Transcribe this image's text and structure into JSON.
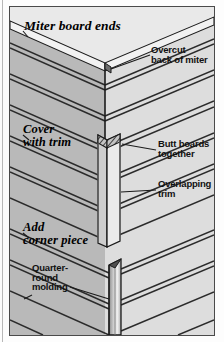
{
  "figure": {
    "panels": [
      {
        "id": "miter",
        "heading": "Miter board ends",
        "callouts": [
          {
            "id": "overcut",
            "text": "Overcut\nback of miter"
          }
        ]
      },
      {
        "id": "trim",
        "heading": "Cover\nwith trim",
        "callouts": [
          {
            "id": "butt-boards",
            "text": "Butt boards\ntogether"
          },
          {
            "id": "overlapping-trim",
            "text": "Overlapping\ntrim"
          }
        ]
      },
      {
        "id": "corner-piece",
        "heading": "Add\ncorner piece",
        "callouts": [
          {
            "id": "quarter-round",
            "text": "Quarter-\nround\nmolding"
          }
        ]
      }
    ]
  },
  "colors": {
    "face_left": "#b9b9b9",
    "face_right": "#dddddd",
    "face_left_dark": "#a9a9a9",
    "board_edge": "#2b2b2b",
    "outline": "#1b1b1b",
    "trim_light": "#e6e6e6",
    "trim_shadow": "#8f8f8f",
    "plate_bg": "#d9d9d9",
    "page_bg": "#fdfdfd",
    "frame": "#4a4a4a"
  }
}
